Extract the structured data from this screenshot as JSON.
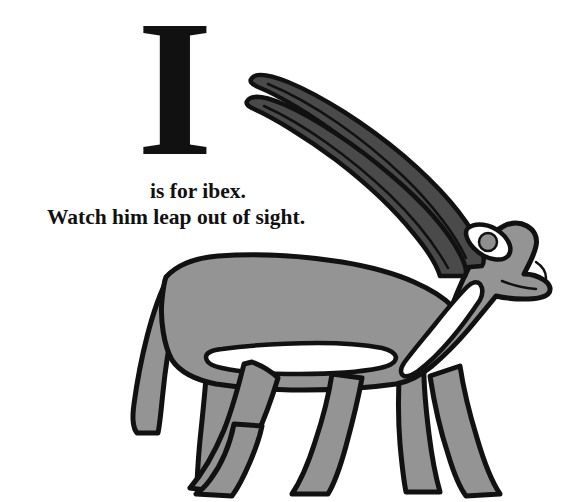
{
  "page": {
    "background_color": "#ffffff",
    "width": 570,
    "height": 502
  },
  "initial": {
    "letter": "I"
  },
  "caption": {
    "line1": "is for ibex.",
    "line2": "Watch him leap out of sight.",
    "text_color": "#111111"
  },
  "illustration": {
    "subject": "ibex",
    "alt": "Side view of a gray ibex walking to the right with two long curved dark horns",
    "colors": {
      "body_gray": "#949494",
      "horn_dark_gray": "#4a4a4a",
      "outline_black": "#111111",
      "belly_white": "#ffffff",
      "eye_iris": "#8f8f8f",
      "eye_white": "#ffffff"
    },
    "parts": [
      "horn-upper",
      "horn-lower",
      "ear",
      "head",
      "eye",
      "muzzle",
      "neck",
      "body",
      "belly-stripe",
      "tail",
      "front-leg-near",
      "front-leg-far",
      "hind-leg-near",
      "hind-leg-far"
    ]
  }
}
